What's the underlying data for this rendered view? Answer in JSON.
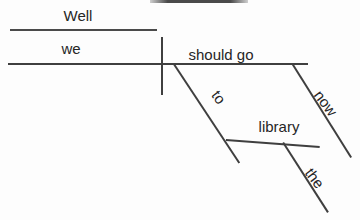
{
  "diagram": {
    "sentence": "Well, we should go to the library now.",
    "words": {
      "interjection": "Well",
      "subject": "we",
      "verb_phrase": "should go",
      "preposition": "to",
      "object_of_preposition": "library",
      "adverb": "now",
      "article": "the"
    },
    "colors": {
      "line": "#3f3f3f",
      "text": "#262626",
      "background": "#fdfdfd"
    }
  }
}
